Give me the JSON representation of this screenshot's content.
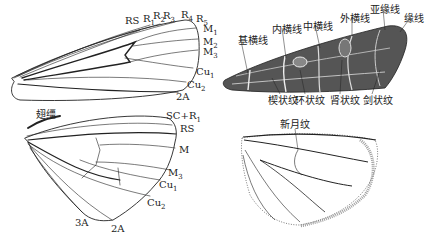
{
  "forewing_venation": {
    "labels": [
      {
        "id": "RS",
        "text": "RS",
        "x": 125,
        "y": 16
      },
      {
        "id": "R1",
        "text": "R",
        "sub": "1",
        "x": 143,
        "y": 14
      },
      {
        "id": "R2",
        "text": "R",
        "sub": "2",
        "x": 153,
        "y": 11
      },
      {
        "id": "R3",
        "text": "R",
        "sub": "3",
        "x": 163,
        "y": 11
      },
      {
        "id": "R4",
        "text": "R",
        "sub": "4",
        "x": 181,
        "y": 10
      },
      {
        "id": "R5",
        "text": "R",
        "sub": "5",
        "x": 196,
        "y": 14
      },
      {
        "id": "M1",
        "text": "M",
        "sub": "1",
        "x": 203,
        "y": 24
      },
      {
        "id": "M2",
        "text": "M",
        "sub": "2",
        "x": 203,
        "y": 37
      },
      {
        "id": "M3",
        "text": "M",
        "sub": "3",
        "x": 203,
        "y": 47
      },
      {
        "id": "Cu1",
        "text": "Cu",
        "sub": "1",
        "x": 196,
        "y": 67
      },
      {
        "id": "Cu2",
        "text": "Cu",
        "sub": "2",
        "x": 187,
        "y": 80
      },
      {
        "id": "2A",
        "text": "2A",
        "x": 176,
        "y": 92
      }
    ]
  },
  "hindwing_venation": {
    "labels": [
      {
        "id": "frenulum",
        "text": "翅缰",
        "x": 36,
        "y": 110,
        "cn": true
      },
      {
        "id": "SC+R1",
        "text": "SC+R",
        "sub": "1",
        "x": 166,
        "y": 111
      },
      {
        "id": "RS",
        "text": "RS",
        "x": 180,
        "y": 124
      },
      {
        "id": "M",
        "text": "M",
        "x": 179,
        "y": 145
      },
      {
        "id": "M3",
        "text": "M",
        "sub": "3",
        "x": 168,
        "y": 168
      },
      {
        "id": "Cu1",
        "text": "Cu",
        "sub": "1",
        "x": 159,
        "y": 180
      },
      {
        "id": "Cu2",
        "text": "Cu",
        "sub": "2",
        "x": 147,
        "y": 198
      },
      {
        "id": "3A",
        "text": "3A",
        "x": 75,
        "y": 218
      },
      {
        "id": "2A",
        "text": "2A",
        "x": 111,
        "y": 224
      }
    ]
  },
  "forewing_pattern": {
    "labels": [
      {
        "id": "basal-line",
        "text": "基横线",
        "x": 238,
        "y": 36
      },
      {
        "id": "antemedial-line",
        "text": "内横线",
        "x": 272,
        "y": 25
      },
      {
        "id": "medial-line",
        "text": "中横线",
        "x": 303,
        "y": 22
      },
      {
        "id": "postmedial-line",
        "text": "外横线",
        "x": 340,
        "y": 14
      },
      {
        "id": "subterminal-line",
        "text": "亚缘线",
        "x": 370,
        "y": 5
      },
      {
        "id": "terminal-line",
        "text": "缘线",
        "x": 404,
        "y": 14
      },
      {
        "id": "claviform-spot",
        "text": "楔状纹",
        "x": 268,
        "y": 96
      },
      {
        "id": "orbicular-spot",
        "text": "环状纹",
        "x": 295,
        "y": 96
      },
      {
        "id": "reniform-spot",
        "text": "肾状纹",
        "x": 330,
        "y": 96
      },
      {
        "id": "dagger-mark",
        "text": "剑状纹",
        "x": 363,
        "y": 96
      }
    ]
  },
  "hindwing_pattern": {
    "labels": [
      {
        "id": "lunule",
        "text": "新月纹",
        "x": 280,
        "y": 120
      }
    ]
  }
}
